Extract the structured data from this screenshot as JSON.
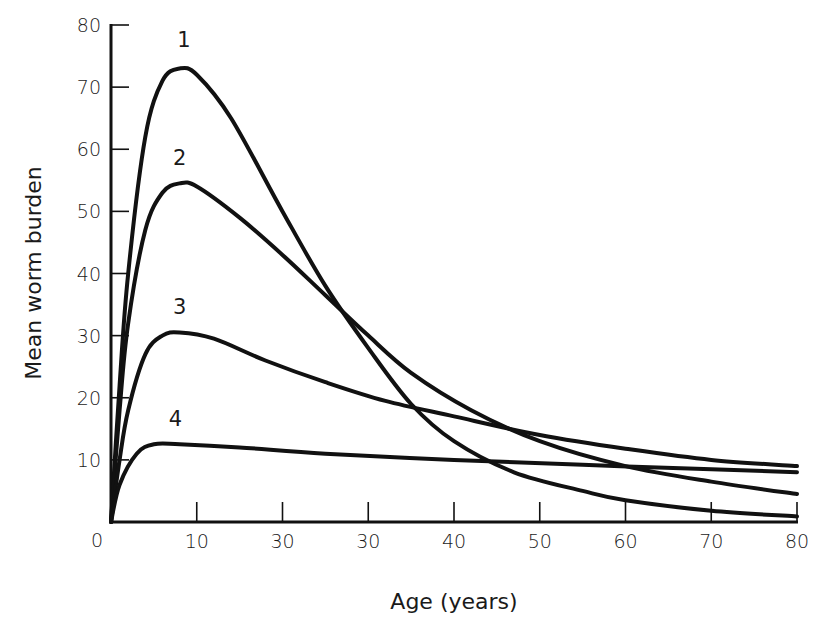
{
  "chart_data": {
    "type": "line",
    "title": "",
    "xlabel": "Age (years)",
    "ylabel": "Mean worm burden",
    "xlim": [
      0,
      80
    ],
    "ylim": [
      0,
      80
    ],
    "grid": false,
    "legend": "inline curve labels",
    "x_tick_labels": [
      "0",
      "10",
      "30",
      "30",
      "40",
      "50",
      "60",
      "70",
      "80"
    ],
    "x_tick_positions": [
      0,
      10,
      20,
      30,
      40,
      50,
      60,
      70,
      80
    ],
    "y_tick_labels": [
      "10",
      "20",
      "30",
      "40",
      "50",
      "60",
      "70",
      "80"
    ],
    "y_tick_positions": [
      10,
      20,
      30,
      40,
      50,
      60,
      70,
      80
    ],
    "series": [
      {
        "name": "1",
        "label_pos": [
          8.5,
          76.5
        ],
        "points": [
          [
            0,
            0
          ],
          [
            1,
            22
          ],
          [
            2,
            40
          ],
          [
            4,
            62
          ],
          [
            6,
            71
          ],
          [
            8,
            73
          ],
          [
            10,
            72
          ],
          [
            14,
            65
          ],
          [
            20,
            50
          ],
          [
            25,
            38
          ],
          [
            30,
            28
          ],
          [
            35,
            19
          ],
          [
            40,
            13
          ],
          [
            47,
            8
          ],
          [
            55,
            5
          ],
          [
            60,
            3.5
          ],
          [
            70,
            1.8
          ],
          [
            80,
            0.9
          ]
        ]
      },
      {
        "name": "2",
        "label_pos": [
          8,
          57.5
        ],
        "points": [
          [
            0,
            0
          ],
          [
            1,
            18
          ],
          [
            2,
            32
          ],
          [
            4,
            47
          ],
          [
            6,
            53
          ],
          [
            8,
            54.5
          ],
          [
            10,
            54
          ],
          [
            15,
            49
          ],
          [
            20,
            43
          ],
          [
            25,
            36.5
          ],
          [
            30,
            30
          ],
          [
            35,
            24
          ],
          [
            42,
            18
          ],
          [
            50,
            13
          ],
          [
            60,
            9
          ],
          [
            70,
            6.5
          ],
          [
            80,
            4.5
          ]
        ]
      },
      {
        "name": "3",
        "label_pos": [
          8,
          33.5
        ],
        "points": [
          [
            0,
            0
          ],
          [
            1,
            10
          ],
          [
            2,
            18
          ],
          [
            4,
            27
          ],
          [
            6,
            30
          ],
          [
            8,
            30.5
          ],
          [
            12,
            29.5
          ],
          [
            18,
            26
          ],
          [
            25,
            22.5
          ],
          [
            32,
            19.5
          ],
          [
            40,
            17
          ],
          [
            50,
            14
          ],
          [
            60,
            11.8
          ],
          [
            70,
            10
          ],
          [
            80,
            9
          ]
        ]
      },
      {
        "name": "4",
        "label_pos": [
          7.5,
          15.5
        ],
        "points": [
          [
            0,
            0
          ],
          [
            1,
            6
          ],
          [
            3,
            11
          ],
          [
            5,
            12.5
          ],
          [
            8,
            12.5
          ],
          [
            15,
            12
          ],
          [
            25,
            11
          ],
          [
            40,
            10
          ],
          [
            55,
            9.2
          ],
          [
            70,
            8.5
          ],
          [
            80,
            8
          ]
        ]
      }
    ]
  },
  "axes": {
    "x_title": "Age (years)",
    "y_title": "Mean worm burden",
    "origin_label": "0"
  }
}
